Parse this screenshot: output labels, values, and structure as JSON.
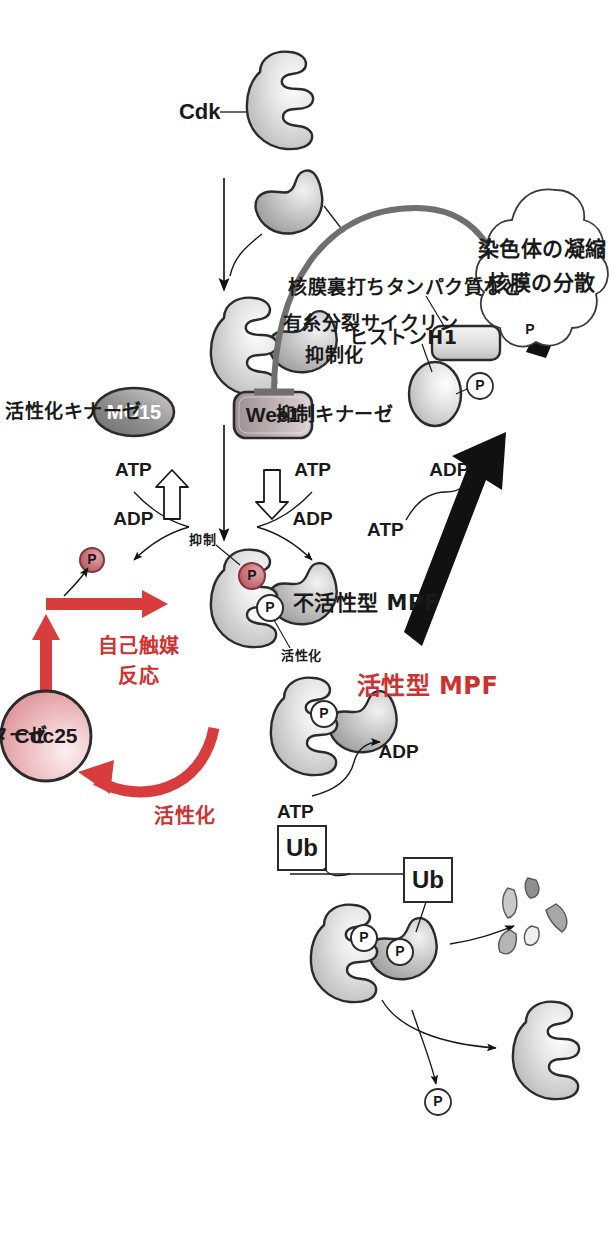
{
  "figure": {
    "title_domain": "cell-cycle MPF regulation diagram",
    "colors": {
      "red": "#cf3030",
      "red_arrow": "#d83c3c",
      "gray_arrow": "#6f6f6f",
      "black": "#111111",
      "cdc25_fill": "#edbcbe",
      "wee1_fill": "#bdb0b2",
      "protein_fill": "#d7d7d7",
      "phosphate_red": "#c9646c",
      "outline": "#2b2b2b"
    }
  },
  "labels": {
    "cdk": "Cdk",
    "mitotic_cyclin": "有糸分裂サイクリン",
    "atp": "ATP",
    "adp": "ADP",
    "wee1": "Wee1",
    "mo15": "MO15",
    "inhibitory_kinase": "抑制キナーゼ",
    "activating_kinase": "活性化キナーゼ",
    "inhibition": "抑制化",
    "inhibit_small": "抑制",
    "activate_small": "活性化",
    "inactive_mpf": "不活性型 MPF",
    "active_mpf": "活性型 MPF",
    "autocatalytic": "自己触媒",
    "autocatalytic_2": "反応",
    "activation_red": "活性化",
    "cdc25": "Cdc25",
    "phosphatase": "ホスファターゼ",
    "histone_h1": "ヒストンH1",
    "lamin_proteins": "核膜裏打ちタンパク質など",
    "cloud_line1": "染色体の凝縮",
    "cloud_line2": "核膜の分散",
    "ub": "Ub",
    "ub2": "Ub",
    "phosphate": "P"
  },
  "nodes": [
    {
      "id": "cdk",
      "label": "Cdk",
      "shape": "cdk-horseshoe"
    },
    {
      "id": "cyclin",
      "label": "有糸分裂サイクリン",
      "shape": "cyclin-blob"
    },
    {
      "id": "cdk-cyclin",
      "label": "",
      "shape": "complex"
    },
    {
      "id": "wee1",
      "label": "Wee1",
      "shape": "rounded-box"
    },
    {
      "id": "mo15",
      "label": "MO15",
      "shape": "ellipse"
    },
    {
      "id": "inactive-mpf",
      "label": "不活性型 MPF",
      "shape": "complex-2p"
    },
    {
      "id": "active-mpf",
      "label": "活性型 MPF",
      "shape": "complex-1p"
    },
    {
      "id": "cdc25",
      "label": "Cdc25",
      "shape": "circle"
    },
    {
      "id": "histone-h1",
      "label": "ヒストンH1",
      "shape": "oval"
    },
    {
      "id": "lamin",
      "label": "核膜裏打ちタンパク質など",
      "shape": "rounded-rect"
    },
    {
      "id": "ubiquitinated-mpf",
      "label": "",
      "shape": "complex-2p"
    },
    {
      "id": "cyclin-fragments",
      "label": "",
      "shape": "fragments"
    },
    {
      "id": "free-cdk",
      "label": "",
      "shape": "cdk-horseshoe"
    },
    {
      "id": "effects-cloud",
      "label": "染色体の凝縮 / 核膜の分散",
      "shape": "cloud"
    }
  ],
  "edges": [
    {
      "from": "cdk",
      "to": "cdk-cyclin",
      "style": "thin-black-arrow"
    },
    {
      "from": "cyclin",
      "to": "cdk-cyclin",
      "style": "thin-black-curve"
    },
    {
      "from": "cdk-cyclin",
      "to": "inactive-mpf",
      "style": "thin-black-arrow"
    },
    {
      "from": "wee1",
      "to": "inactive-mpf",
      "style": "atp-adp-open-arrow",
      "labels": [
        "ATP",
        "ADP"
      ]
    },
    {
      "from": "mo15",
      "to": "inactive-mpf",
      "style": "atp-adp-open-arrow",
      "labels": [
        "ATP",
        "ADP"
      ]
    },
    {
      "from": "cdc25",
      "to": "inactive-mpf",
      "style": "red-thick-arrow"
    },
    {
      "from": "inactive-mpf",
      "to": "active-mpf",
      "style": "red-thick-arrow"
    },
    {
      "from": "active-mpf",
      "to": "cdc25",
      "style": "red-curved-arrow",
      "label": "活性化"
    },
    {
      "from": "active-mpf",
      "to": "histone-h1",
      "style": "thick-black-arrow",
      "labels": [
        "ATP",
        "ADP"
      ]
    },
    {
      "from": "histone-h1",
      "to": "effects-cloud",
      "style": "thick-black-arrow"
    },
    {
      "from": "active-mpf",
      "to": "wee1",
      "style": "gray-inhibition-arc",
      "label": "抑制化"
    },
    {
      "from": "active-mpf",
      "to": "ubiquitinated-mpf",
      "style": "thin-black-arrow",
      "label": "Ub"
    },
    {
      "from": "ubiquitinated-mpf",
      "to": "cyclin-fragments",
      "style": "thin-black-curve"
    },
    {
      "from": "ubiquitinated-mpf",
      "to": "free-cdk",
      "style": "thin-black-curve"
    },
    {
      "from": "ubiquitinated-mpf",
      "to": "phosphate",
      "style": "thin-black-curve",
      "label": "P"
    }
  ]
}
